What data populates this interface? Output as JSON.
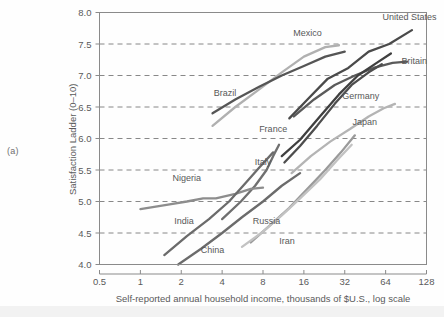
{
  "panel": {
    "label": "(a)"
  },
  "chart_data": {
    "type": "line",
    "title": "",
    "xlabel": "Self-reported annual household income, thousands of $U.S., log scale",
    "ylabel": "Satisfaction Ladder (0–10)",
    "xscale": "log2",
    "xlim": [
      0.5,
      128
    ],
    "ylim": [
      4.0,
      8.0
    ],
    "xticks": [
      "0.5",
      "1",
      "2",
      "4",
      "8",
      "16",
      "32",
      "64",
      "128"
    ],
    "xtick_values": [
      0.5,
      1,
      2,
      4,
      8,
      16,
      32,
      64,
      128
    ],
    "yticks": [
      "4.0",
      "4.5",
      "5.0",
      "5.5",
      "6.0",
      "6.5",
      "7.0",
      "7.5",
      "8.0"
    ],
    "ytick_values": [
      4.0,
      4.5,
      5.0,
      5.5,
      6.0,
      6.5,
      7.0,
      7.5,
      8.0
    ],
    "grid": "horizontal-dashed",
    "legend": "inline-labels",
    "series": [
      {
        "name": "United States",
        "color": "#4a4a4a",
        "label_x": 96,
        "label_y": 7.88,
        "points": [
          [
            12.5,
            6.32
          ],
          [
            17,
            6.62
          ],
          [
            24,
            6.95
          ],
          [
            34,
            7.12
          ],
          [
            48,
            7.38
          ],
          [
            68,
            7.5
          ],
          [
            100,
            7.72
          ]
        ]
      },
      {
        "name": "Britain",
        "color": "#5a5a5a",
        "label_x": 104,
        "label_y": 7.18,
        "points": [
          [
            13.5,
            6.35
          ],
          [
            19,
            6.62
          ],
          [
            27,
            6.85
          ],
          [
            38,
            7.0
          ],
          [
            52,
            7.12
          ],
          [
            72,
            7.2
          ],
          [
            92,
            7.22
          ]
        ]
      },
      {
        "name": "Germany",
        "color": "#3f3f3f",
        "label_x": 42,
        "label_y": 6.62,
        "points": [
          [
            11,
            5.72
          ],
          [
            15,
            5.98
          ],
          [
            21,
            6.35
          ],
          [
            29,
            6.7
          ],
          [
            40,
            7.0
          ],
          [
            55,
            7.2
          ],
          [
            70,
            7.35
          ]
        ]
      },
      {
        "name": "Mexico",
        "color": "#b0b0b0",
        "label_x": 17,
        "label_y": 7.62,
        "points": [
          [
            3.4,
            6.2
          ],
          [
            5,
            6.5
          ],
          [
            7.5,
            6.78
          ],
          [
            11,
            7.05
          ],
          [
            16,
            7.3
          ],
          [
            23,
            7.45
          ],
          [
            29,
            7.48
          ]
        ]
      },
      {
        "name": "Brazil",
        "color": "#555555",
        "label_x": 4.2,
        "label_y": 6.68,
        "points": [
          [
            3.4,
            6.4
          ],
          [
            5,
            6.62
          ],
          [
            7.5,
            6.82
          ],
          [
            11,
            7.0
          ],
          [
            16,
            7.15
          ],
          [
            23,
            7.3
          ],
          [
            32,
            7.38
          ]
        ]
      },
      {
        "name": "France",
        "color": "#4d4d4d",
        "label_x": 9.5,
        "label_y": 6.1,
        "points": [
          [
            11.5,
            5.62
          ],
          [
            15,
            5.88
          ],
          [
            20,
            6.2
          ],
          [
            27,
            6.55
          ],
          [
            36,
            6.85
          ],
          [
            48,
            7.05
          ],
          [
            60,
            7.18
          ]
        ]
      },
      {
        "name": "Japan",
        "color": "#b4b4b4",
        "label_x": 45,
        "label_y": 6.22,
        "points": [
          [
            13,
            5.45
          ],
          [
            18,
            5.72
          ],
          [
            25,
            5.95
          ],
          [
            35,
            6.15
          ],
          [
            48,
            6.35
          ],
          [
            62,
            6.48
          ],
          [
            75,
            6.55
          ]
        ]
      },
      {
        "name": "Italy",
        "color": "#6f6f6f",
        "label_x": 8.0,
        "label_y": 5.58,
        "points": [
          [
            4.0,
            4.72
          ],
          [
            5.5,
            5.0
          ],
          [
            7,
            5.25
          ],
          [
            8.5,
            5.5
          ],
          [
            9.5,
            5.72
          ],
          [
            10.5,
            5.9
          ]
        ]
      },
      {
        "name": "Nigeria",
        "color": "#8d8d8d",
        "label_x": 2.2,
        "label_y": 5.32,
        "points": [
          [
            1.0,
            4.88
          ],
          [
            1.6,
            4.95
          ],
          [
            2.2,
            5.0
          ],
          [
            2.9,
            5.05
          ],
          [
            3.6,
            5.05
          ],
          [
            5.0,
            5.12
          ],
          [
            6.5,
            5.2
          ],
          [
            8.0,
            5.22
          ]
        ]
      },
      {
        "name": "India",
        "color": "#6b6b6b",
        "label_x": 2.1,
        "label_y": 4.65,
        "points": [
          [
            1.5,
            4.15
          ],
          [
            2.2,
            4.45
          ],
          [
            3.2,
            4.72
          ],
          [
            4.5,
            5.0
          ],
          [
            6.0,
            5.3
          ],
          [
            7.6,
            5.55
          ],
          [
            9.5,
            5.78
          ]
        ]
      },
      {
        "name": "China",
        "color": "#6b6b6b",
        "label_x": 3.4,
        "label_y": 4.18,
        "points": [
          [
            1.9,
            4.0
          ],
          [
            2.8,
            4.25
          ],
          [
            4.0,
            4.5
          ],
          [
            5.6,
            4.75
          ],
          [
            8.0,
            5.0
          ],
          [
            11,
            5.25
          ],
          [
            15,
            5.45
          ]
        ]
      },
      {
        "name": "Russia",
        "color": "#9a9a9a",
        "label_x": 8.5,
        "label_y": 4.65,
        "points": [
          [
            6.5,
            4.35
          ],
          [
            9,
            4.62
          ],
          [
            12.5,
            4.9
          ],
          [
            17,
            5.2
          ],
          [
            23,
            5.5
          ],
          [
            30,
            5.78
          ],
          [
            38,
            6.05
          ]
        ]
      },
      {
        "name": "Iran",
        "color": "#c2c2c2",
        "label_x": 12,
        "label_y": 4.32,
        "points": [
          [
            5.6,
            4.28
          ],
          [
            8,
            4.52
          ],
          [
            11,
            4.78
          ],
          [
            15,
            5.05
          ],
          [
            21,
            5.35
          ],
          [
            28,
            5.65
          ],
          [
            36,
            5.9
          ]
        ]
      }
    ]
  }
}
